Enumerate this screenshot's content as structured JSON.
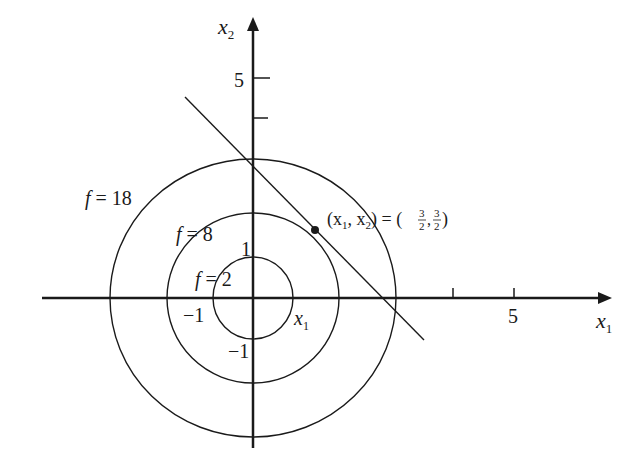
{
  "diagram": {
    "type": "contour-plot",
    "axes": {
      "x_label": "x",
      "x_label_sub": "1",
      "y_label": "x",
      "y_label_sub": "2",
      "x_ticks": [
        {
          "value": "-1",
          "label": "−1"
        },
        {
          "value": "4",
          "label": ""
        },
        {
          "value": "5",
          "label": "5"
        }
      ],
      "y_ticks": [
        {
          "value": "1",
          "label": "1"
        },
        {
          "value": "-1",
          "label": "−1"
        },
        {
          "value": "4",
          "label": ""
        },
        {
          "value": "5",
          "label": "5"
        }
      ],
      "inner_x_label": "x",
      "inner_x_label_sub": "1"
    },
    "contours": [
      {
        "name": "f-2",
        "label_f": "f",
        "label_eq": " = 2",
        "value": 2,
        "radius": 1
      },
      {
        "name": "f-8",
        "label_f": "f",
        "label_eq": " = 8",
        "value": 8,
        "radius": 2
      },
      {
        "name": "f-18",
        "label_f": "f",
        "label_eq": " = 18",
        "value": 18,
        "radius": 3
      }
    ],
    "constraint_line": {
      "equation": "x1 + x2 = 3"
    },
    "optimum_point": {
      "label_prefix": "(x",
      "label_sub1": "1",
      "label_mid": ", x",
      "label_sub2": "2",
      "label_eq": ") = (",
      "num": "3",
      "den": "2",
      "sep": ",",
      "label_close": ")"
    },
    "colors": {
      "stroke": "#1a1a1a",
      "background": "#ffffff"
    }
  }
}
